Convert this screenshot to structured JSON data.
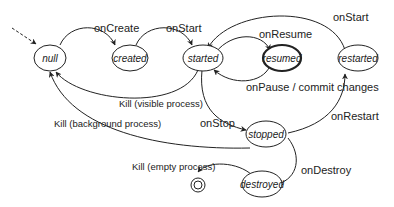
{
  "diagram": {
    "type": "state-machine",
    "title": "",
    "states": [
      {
        "id": "null",
        "label": "null"
      },
      {
        "id": "created",
        "label": "created"
      },
      {
        "id": "started",
        "label": "started"
      },
      {
        "id": "resumed",
        "label": "resumed",
        "emphasized": true
      },
      {
        "id": "restarted",
        "label": "restarted"
      },
      {
        "id": "stopped",
        "label": "stopped"
      },
      {
        "id": "destroyed",
        "label": "destroyed"
      },
      {
        "id": "final",
        "label": "",
        "kind": "final-state"
      }
    ],
    "transitions": [
      {
        "from": "initial",
        "to": "null",
        "label": "",
        "style": "dashed"
      },
      {
        "from": "null",
        "to": "created",
        "label": "onCreate"
      },
      {
        "from": "created",
        "to": "started",
        "label": "onStart"
      },
      {
        "from": "started",
        "to": "resumed",
        "label": "onResume"
      },
      {
        "from": "resumed",
        "to": "started",
        "label": "onPause / commit changes"
      },
      {
        "from": "restarted",
        "to": "started",
        "label": "onStart"
      },
      {
        "from": "started",
        "to": "null",
        "label": "Kill (visible process)"
      },
      {
        "from": "stopped",
        "to": "null",
        "label": "Kill (background process)"
      },
      {
        "from": "started",
        "to": "stopped",
        "label": "onStop"
      },
      {
        "from": "stopped",
        "to": "restarted",
        "label": "onRestart"
      },
      {
        "from": "stopped",
        "to": "destroyed",
        "label": "onDestroy"
      },
      {
        "from": "destroyed",
        "to": "final",
        "label": "Kill (empty process)"
      }
    ]
  },
  "labels": {
    "s_null": "null",
    "s_created": "created",
    "s_started": "started",
    "s_resumed": "resumed",
    "s_restarted": "restarted",
    "s_stopped": "stopped",
    "s_destroyed": "destroyed",
    "t_onCreate": "onCreate",
    "t_onStart1": "onStart",
    "t_onResume": "onResume",
    "t_onPause": "onPause / commit changes",
    "t_onStart2": "onStart",
    "t_killVisible": "Kill (visible process)",
    "t_killBackground": "Kill (background process)",
    "t_onStop": "onStop",
    "t_onRestart": "onRestart",
    "t_onDestroy": "onDestroy",
    "t_killEmpty": "Kill (empty process)"
  }
}
